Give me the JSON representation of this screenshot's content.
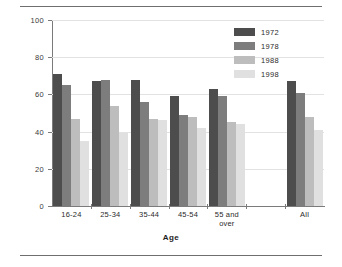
{
  "chart_data": {
    "type": "bar",
    "title": "",
    "xlabel": "Age",
    "ylabel": "Percentage",
    "ylim": [
      0,
      100
    ],
    "yticks": [
      0,
      20,
      40,
      60,
      80,
      100
    ],
    "grid": true,
    "legend_position": "top-right",
    "categories": [
      "16-24",
      "25-34",
      "35-44",
      "45-54",
      "55 and over",
      "All"
    ],
    "series": [
      {
        "name": "1972",
        "color": "#4d4d4d",
        "values": [
          71,
          67,
          68,
          59,
          63,
          67
        ]
      },
      {
        "name": "1978",
        "color": "#7d7d7d",
        "values": [
          65,
          68,
          56,
          49,
          59,
          61
        ]
      },
      {
        "name": "1988",
        "color": "#bdbdbd",
        "values": [
          47,
          54,
          47,
          48,
          45,
          48
        ]
      },
      {
        "name": "1998",
        "color": "#e0e0e0",
        "values": [
          35,
          39,
          46,
          42,
          44,
          41
        ]
      }
    ]
  },
  "axes": {
    "y_title": "Percentage",
    "x_title": "Age",
    "y_tick_labels": [
      "0",
      "20",
      "40",
      "60",
      "80",
      "100"
    ]
  },
  "legend": {
    "items": [
      {
        "label": "1972"
      },
      {
        "label": "1978"
      },
      {
        "label": "1988"
      },
      {
        "label": "1998"
      }
    ]
  },
  "categories": [
    {
      "label": "16-24"
    },
    {
      "label": "25-34"
    },
    {
      "label": "35-44"
    },
    {
      "label": "45-54"
    },
    {
      "label": "55 and\nover"
    },
    {
      "label": "All"
    }
  ]
}
